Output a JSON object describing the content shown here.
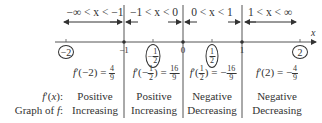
{
  "intervals": [
    {
      "label": "−∞ < x < −1",
      "test_point": "−2",
      "derivative": "f′(−2) = ",
      "deriv_num": "4",
      "deriv_den": "9",
      "deriv_sign": "",
      "sign": "Positive",
      "behavior": "Increasing"
    },
    {
      "label": "−1 < x < 0",
      "test_point_sign": "−",
      "test_num": "1",
      "test_den": "2",
      "derivative_prefix": "f′(−",
      "derivative_suffix": ") = ",
      "deriv_num": "16",
      "deriv_den": "9",
      "deriv_sign": "",
      "sign": "Positive",
      "behavior": "Increasing"
    },
    {
      "label": "0 < x < 1",
      "test_num": "1",
      "test_den": "2",
      "derivative_prefix": "f′(",
      "derivative_suffix": ") = −",
      "deriv_num": "16",
      "deriv_den": "9",
      "sign": "Negative",
      "behavior": "Decreasing"
    },
    {
      "label": "1 < x < ∞",
      "test_point": "2",
      "derivative": "f′(2) = −",
      "deriv_num": "4",
      "deriv_den": "9",
      "sign": "Negative",
      "behavior": "Decreasing"
    }
  ],
  "axis": {
    "variable": "x",
    "ticks": [
      "−1",
      "0",
      "1"
    ]
  },
  "row_labels": {
    "derivative": "f′(x):",
    "graph": "Graph of f:"
  },
  "colors": {
    "line": "#333333",
    "text": "#333333",
    "background": "#ffffff"
  }
}
